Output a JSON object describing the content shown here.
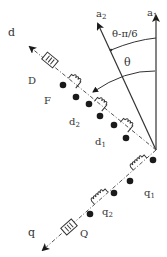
{
  "diagram": {
    "labels": {
      "a1": "a",
      "a1_sub": "1",
      "a2": "a",
      "a2_sub": "2",
      "angle_outer": "θ-π/6",
      "angle_inner": "θ",
      "d": "d",
      "q": "q",
      "D": "D",
      "F": "F",
      "d2": "d",
      "d2_sub": "2",
      "d1": "d",
      "d1_sub": "1",
      "q1": "q",
      "q1_sub": "1",
      "q2": "q",
      "q2_sub": "2",
      "Q": "Q"
    },
    "colors": {
      "line": "#333333",
      "fill": "#1a1a1a",
      "background": "#ffffff"
    },
    "axes": [
      {
        "name": "a1",
        "style": "solid",
        "direction": "vertical-up"
      },
      {
        "name": "a2",
        "style": "solid",
        "direction": "tilted-left"
      },
      {
        "name": "d",
        "style": "dash-dot",
        "direction": "upper-left"
      },
      {
        "name": "q",
        "style": "dash-dot",
        "direction": "lower-left"
      }
    ],
    "coils": [
      "D",
      "F",
      "d2",
      "d1",
      "q1",
      "q2",
      "Q"
    ]
  }
}
